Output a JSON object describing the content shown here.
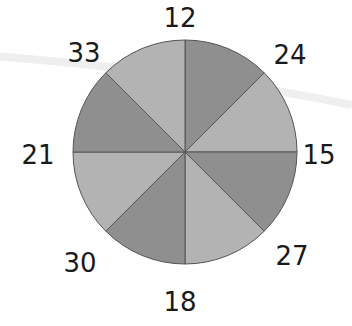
{
  "spinner": {
    "center": [
      185,
      152
    ],
    "radius": 112,
    "sections": 8,
    "colors": {
      "light": "#b3b3b3",
      "dark": "#8f8f8f",
      "outline": "#555555"
    },
    "labels": [
      {
        "text": "12",
        "x": 180,
        "y": 18
      },
      {
        "text": "24",
        "x": 290,
        "y": 55
      },
      {
        "text": "15",
        "x": 319,
        "y": 155
      },
      {
        "text": "27",
        "x": 292,
        "y": 256
      },
      {
        "text": "18",
        "x": 180,
        "y": 302
      },
      {
        "text": "30",
        "x": 80,
        "y": 263
      },
      {
        "text": "21",
        "x": 38,
        "y": 155
      },
      {
        "text": "33",
        "x": 84,
        "y": 53
      }
    ]
  }
}
